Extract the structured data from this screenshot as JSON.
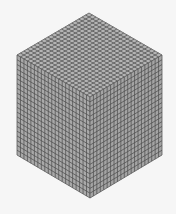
{
  "figure": {
    "divisions": 21,
    "colors": {
      "background": "#f6f6f6",
      "top_face": "#b3b3b3",
      "left_face": "#a9a9a9",
      "right_face": "#a4a4a4",
      "grid_line": "#4f4f4f",
      "outline": "#5a5a5a"
    },
    "vertices": {
      "top": [
        89,
        13
      ],
      "left_top": [
        17,
        55
      ],
      "right_top": [
        162,
        55
      ],
      "center": [
        90,
        97
      ],
      "left_bottom": [
        17,
        155
      ],
      "right_bottom": [
        162,
        155
      ],
      "bottom": [
        90,
        198
      ]
    }
  }
}
